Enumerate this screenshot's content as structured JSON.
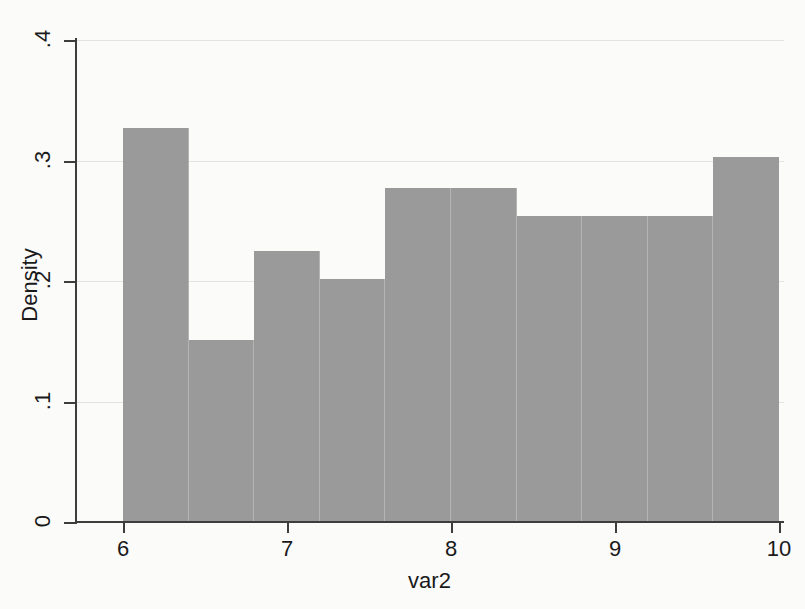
{
  "chart_data": {
    "type": "bar",
    "title": "",
    "subtitle": "",
    "xlabel": "var2",
    "ylabel": "Density",
    "xlim": [
      6,
      10
    ],
    "ylim": [
      0,
      0.4
    ],
    "grid": true,
    "legend": null,
    "bar_color": "#9a9a9a",
    "bar_edge_color": "#b4b4b4",
    "axis_color": "#3d3d3d",
    "gridline_color": "#e3e3e0",
    "background_color": "#fbfbfa",
    "plot_background_color": "#ffffff",
    "histogram": true,
    "bin_width": 0.4,
    "bin_count": 10,
    "bin_edges": [
      6.0,
      6.4,
      6.8,
      7.2,
      7.6,
      8.0,
      8.4,
      8.8,
      9.2,
      9.6,
      10.0
    ],
    "categories": [
      "6.0-6.4",
      "6.4-6.8",
      "6.8-7.2",
      "7.2-7.6",
      "7.6-8.0",
      "8.0-8.4",
      "8.4-8.8",
      "8.8-9.2",
      "9.2-9.6",
      "9.6-10.0"
    ],
    "values": [
      0.327,
      0.151,
      0.225,
      0.202,
      0.277,
      0.277,
      0.254,
      0.254,
      0.254,
      0.303
    ],
    "xticks": [
      6,
      7,
      8,
      9,
      10
    ],
    "xticklabels": [
      "6",
      "7",
      "8",
      "9",
      "10"
    ],
    "yticks": [
      0,
      0.1,
      0.2,
      0.3,
      0.4
    ],
    "yticklabels": [
      "0",
      ".1",
      ".2",
      ".3",
      ".4"
    ]
  },
  "axes": {
    "y_title": "Density",
    "x_title": "var2"
  }
}
